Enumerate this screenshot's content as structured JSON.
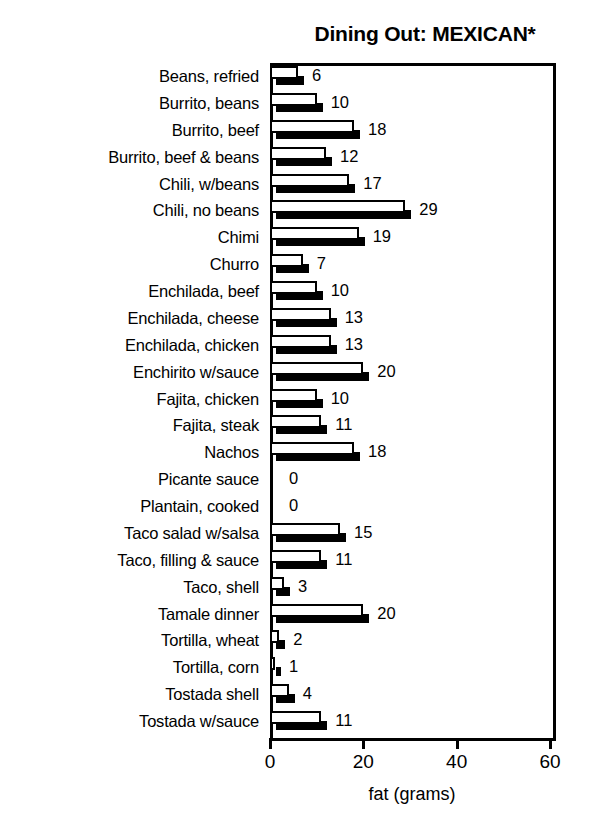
{
  "chart_data": {
    "type": "bar",
    "orientation": "horizontal",
    "title": "Dining Out: MEXICAN*",
    "xlabel": "fat (grams)",
    "ylabel": "",
    "xlim": [
      0,
      60
    ],
    "xticks": [
      0,
      20,
      40,
      60
    ],
    "xtick_labels": [
      "0",
      "20",
      "40",
      "60"
    ],
    "grid": false,
    "legend": null,
    "value_labels_shown": true,
    "bar_style": "white-fill-black-outline-with-black-drop-shadow",
    "categories": [
      "Beans, refried",
      "Burrito, beans",
      "Burrito, beef",
      "Burrito, beef & beans",
      "Chili, w/beans",
      "Chili, no beans",
      "Chimi",
      "Churro",
      "Enchilada, beef",
      "Enchilada, cheese",
      "Enchilada, chicken",
      "Enchirito w/sauce",
      "Fajita, chicken",
      "Fajita, steak",
      "Nachos",
      "Picante sauce",
      "Plantain, cooked",
      "Taco salad w/salsa",
      "Taco, filling & sauce",
      "Taco, shell",
      "Tamale dinner",
      "Tortilla, wheat",
      "Tortilla, corn",
      "Tostada shell",
      "Tostada w/sauce"
    ],
    "values": [
      6,
      10,
      18,
      12,
      17,
      29,
      19,
      7,
      10,
      13,
      13,
      20,
      10,
      11,
      18,
      0,
      0,
      15,
      11,
      3,
      20,
      2,
      1,
      4,
      11
    ],
    "value_label_texts": [
      "6",
      "10",
      "18",
      "12",
      "17",
      "29",
      "19",
      "7",
      "10",
      "13",
      "13",
      "20",
      "10",
      "11",
      "18",
      "0",
      "0",
      "15",
      "11",
      "3",
      "20",
      "2",
      "1",
      "4",
      "11"
    ],
    "colors": {
      "bar_face": "#ffffff",
      "bar_outline": "#000000",
      "bar_shadow": "#000000",
      "axis": "#000000",
      "text": "#000000",
      "background": "#ffffff"
    }
  },
  "axis": {
    "x_title": "fat (grams)",
    "tick_labels": [
      "0",
      "20",
      "40",
      "60"
    ]
  },
  "header": {
    "title": "Dining Out: MEXICAN*"
  }
}
